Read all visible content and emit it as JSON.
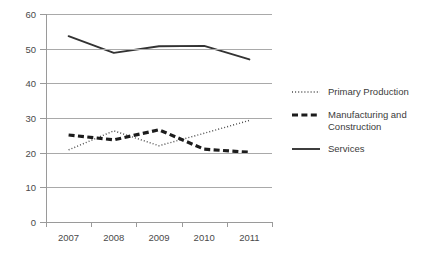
{
  "chart_data": {
    "type": "line",
    "title": "",
    "xlabel": "",
    "ylabel": "",
    "categories": [
      "2007",
      "2008",
      "2009",
      "2010",
      "2011"
    ],
    "ylim": [
      0,
      60
    ],
    "yticks": [
      0,
      10,
      20,
      30,
      40,
      50,
      60
    ],
    "grid": "horizontal",
    "legend_position": "right",
    "series": [
      {
        "name": "Primary Production",
        "style": "dotted",
        "color": "#4a4a4a",
        "values": [
          20.8,
          26.3,
          22.0,
          25.6,
          29.3
        ]
      },
      {
        "name": "Manufacturing and Construction",
        "style": "dashed",
        "color": "#1c1c1c",
        "values": [
          25.1,
          23.7,
          26.6,
          21.0,
          20.1
        ]
      },
      {
        "name": "Services",
        "style": "solid",
        "color": "#333333",
        "values": [
          53.6,
          48.8,
          50.7,
          50.8,
          46.9
        ]
      }
    ]
  },
  "legend": {
    "items": [
      {
        "label": "Primary Production"
      },
      {
        "label": "Manufacturing and Construction"
      },
      {
        "label": "Services"
      }
    ]
  }
}
